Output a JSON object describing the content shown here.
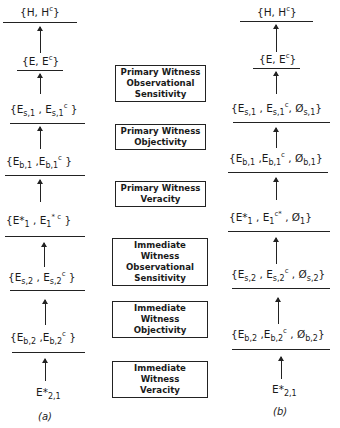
{
  "diagram": {
    "left": {
      "caption": "(a)",
      "nodes": [
        {
          "id": "H",
          "base": "{H, H",
          "sup": "c",
          "tail": "}"
        },
        {
          "id": "E",
          "base": "{E, E",
          "sup": "c",
          "tail": "}"
        },
        {
          "id": "Es1",
          "text": "{E_s,1 , E^c_s,1 }"
        },
        {
          "id": "Eb1",
          "text": "{E_b,1 ,E^c_b,1 }"
        },
        {
          "id": "Estar1",
          "text": "{E*_1 , E*^c_1 }"
        },
        {
          "id": "Es2",
          "text": "{E_s,2 , E^c_s,2 }"
        },
        {
          "id": "Eb2",
          "text": "{E_b,2 ,E_b,2^c }"
        },
        {
          "id": "Estar21",
          "text": "E*_2,1"
        }
      ]
    },
    "right": {
      "caption": "(b)",
      "nodes": [
        {
          "id": "H",
          "text": "{H, H^c}"
        },
        {
          "id": "E",
          "text": "{E, E^c}"
        },
        {
          "id": "Es1",
          "text": "{E_s,1 , E^c_s,1 , Ø_s,1 }"
        },
        {
          "id": "Eb1",
          "text": "{E_b,1 ,E^c_b,1 , Ø_b,1 }"
        },
        {
          "id": "Estar1",
          "text": "{E*_1 , E^c*_1 , Ø_1 }"
        },
        {
          "id": "Es2",
          "text": "{E_s,2 , E^c_s,2 , Ø_s,2 }"
        },
        {
          "id": "Eb2",
          "text": "{E_b,2 ,E^c_b,2 , Ø_b,2 }"
        },
        {
          "id": "Estar21",
          "text": "E*_2,1"
        }
      ]
    },
    "boxes": [
      {
        "line1": "Primary Witness",
        "line2": "Observational",
        "line3": "Sensitivity"
      },
      {
        "line1": "Primary Witness",
        "line2": "Objectivity"
      },
      {
        "line1": "Primary Witness",
        "line2": "Veracity"
      },
      {
        "line1": "Immediate Witness",
        "line2": "Observational",
        "line3": "Sensitivity"
      },
      {
        "line1": "Immediate Witness",
        "line2": "Objectivity"
      },
      {
        "line1": "Immediate Witness",
        "line2": "Veracity"
      }
    ],
    "symbols": {
      "H": "H",
      "E": "E",
      "c": "c",
      "star": "*",
      "empty": "Ø",
      "s1": "s,1",
      "b1": "b,1",
      "one": "1",
      "s2": "s,2",
      "b2": "b,2",
      "two_one": "2,1",
      "open": "{",
      "close": "}",
      "comma": ",",
      "estar": "E*"
    }
  }
}
